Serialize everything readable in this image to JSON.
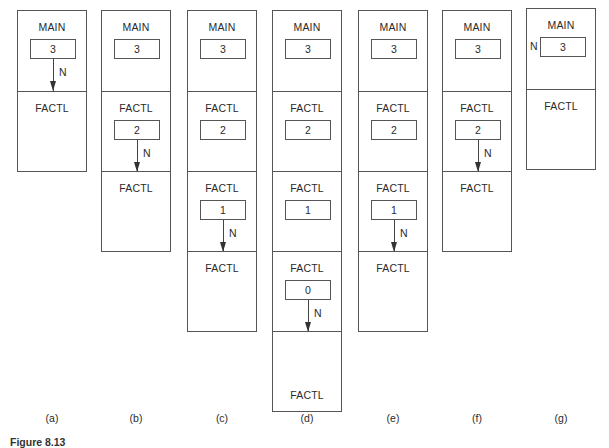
{
  "diagram": {
    "stacks": [
      {
        "label": "(a)",
        "frames": [
          {
            "name": "MAIN",
            "value": "3",
            "arrow": true,
            "arrow_label": "N"
          },
          {
            "name": "FACTL",
            "value": null
          }
        ]
      },
      {
        "label": "(b)",
        "frames": [
          {
            "name": "MAIN",
            "value": "3"
          },
          {
            "name": "FACTL",
            "value": "2",
            "arrow": true,
            "arrow_label": "N"
          },
          {
            "name": "FACTL",
            "value": null
          }
        ]
      },
      {
        "label": "(c)",
        "frames": [
          {
            "name": "MAIN",
            "value": "3"
          },
          {
            "name": "FACTL",
            "value": "2"
          },
          {
            "name": "FACTL",
            "value": "1",
            "arrow": true,
            "arrow_label": "N"
          },
          {
            "name": "FACTL",
            "value": null
          }
        ]
      },
      {
        "label": "(d)",
        "frames": [
          {
            "name": "MAIN",
            "value": "3"
          },
          {
            "name": "FACTL",
            "value": "2"
          },
          {
            "name": "FACTL",
            "value": "1"
          },
          {
            "name": "FACTL",
            "value": "0",
            "arrow": true,
            "arrow_label": "N"
          },
          {
            "name": "FACTL",
            "value": null,
            "title_at_bottom": true
          }
        ]
      },
      {
        "label": "(e)",
        "frames": [
          {
            "name": "MAIN",
            "value": "3"
          },
          {
            "name": "FACTL",
            "value": "2"
          },
          {
            "name": "FACTL",
            "value": "1",
            "arrow": true,
            "arrow_label": "N"
          },
          {
            "name": "FACTL",
            "value": null
          }
        ]
      },
      {
        "label": "(f)",
        "frames": [
          {
            "name": "MAIN",
            "value": "3"
          },
          {
            "name": "FACTL",
            "value": "2",
            "arrow": true,
            "arrow_label": "N"
          },
          {
            "name": "FACTL",
            "value": null
          }
        ]
      },
      {
        "label": "(g)",
        "frames": [
          {
            "name": "MAIN",
            "value": "3",
            "side_label": "N"
          },
          {
            "name": "FACTL",
            "value": null
          }
        ]
      }
    ],
    "caption": "Figure 8.13"
  }
}
